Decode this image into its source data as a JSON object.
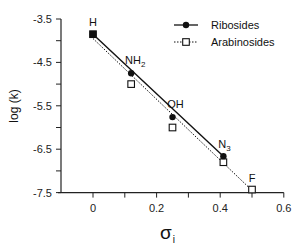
{
  "chart_data": {
    "type": "scatter",
    "title": "",
    "xlabel": "σ",
    "xlabel_subscript": "i",
    "ylabel": "log (k)",
    "xlim": [
      -0.1,
      0.6
    ],
    "ylim": [
      -7.5,
      -3.5
    ],
    "x_ticks": [
      0,
      0.2,
      0.4,
      0.6
    ],
    "x_tick_labels": [
      "0",
      "0.2",
      "0.4",
      "0.6"
    ],
    "x_minor_ticks": [
      0.1,
      0.3,
      0.5
    ],
    "y_ticks": [
      -3.5,
      -4.5,
      -5.5,
      -6.5,
      -7.5
    ],
    "y_tick_labels": [
      "-3.5",
      "-4.5",
      "-5.5",
      "-6.5",
      "-7.5"
    ],
    "y_minor_ticks": [
      -4.0,
      -5.0,
      -6.0,
      -7.0
    ],
    "grid": false,
    "legend_position": "upper right",
    "series": [
      {
        "name": "Ribosides",
        "marker": "filled-circle",
        "line": "solid",
        "color": "#111111",
        "x": [
          0,
          0.12,
          0.25,
          0.41
        ],
        "y": [
          -3.85,
          -4.75,
          -5.76,
          -6.66
        ],
        "fit": {
          "x": [
            0,
            0.41
          ],
          "y": [
            -3.85,
            -6.66
          ]
        }
      },
      {
        "name": "Arabinosides",
        "marker": "open-square",
        "line": "dotted",
        "color": "#111111",
        "x": [
          0,
          0.12,
          0.25,
          0.41,
          0.5
        ],
        "y": [
          -3.85,
          -5.0,
          -6.0,
          -6.8,
          -7.43
        ],
        "fit": {
          "x": [
            0,
            0.5
          ],
          "y": [
            -3.95,
            -7.45
          ]
        }
      }
    ],
    "annotations": [
      {
        "text": "H",
        "x": 0,
        "y": -3.85
      },
      {
        "text": "NH",
        "sub": "2",
        "x": 0.12,
        "y": -4.75
      },
      {
        "text": "OH",
        "x": 0.25,
        "y": -5.76
      },
      {
        "text": "N",
        "sub": "3",
        "x": 0.41,
        "y": -6.66
      },
      {
        "text": "F",
        "x": 0.5,
        "y": -7.43
      }
    ]
  }
}
